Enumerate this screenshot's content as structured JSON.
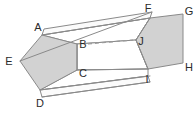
{
  "figure": {
    "shape_type": "pentagonal-prism",
    "style": {
      "stroke_color": "#8a8a8a",
      "face_fill": "#d2d2d2",
      "body_fill": "#ffffff",
      "dashed_edge_color": "#9a9a9a",
      "label_color": "#2b2b2b",
      "background": "#ffffff",
      "stroke_width": 1,
      "label_font_size": 11
    },
    "vertices": [
      {
        "id": "A",
        "label": "A",
        "x": 42,
        "y": 35,
        "label_x": 38,
        "label_y": 30,
        "face": "near-left",
        "hidden": false
      },
      {
        "id": "B",
        "label": "B",
        "x": 77,
        "y": 44,
        "label_x": 75,
        "label_y": 48,
        "face": "far-left",
        "hidden": true
      },
      {
        "id": "C",
        "label": "C",
        "x": 77,
        "y": 70,
        "label_x": 75,
        "label_y": 77,
        "face": "near-left",
        "hidden": false
      },
      {
        "id": "D",
        "label": "D",
        "x": 40,
        "y": 90,
        "label_x": 36,
        "label_y": 105,
        "face": "near-left",
        "hidden": false
      },
      {
        "id": "E",
        "label": "E",
        "x": 20,
        "y": 61,
        "label_x": 5,
        "label_y": 65,
        "face": "near-left",
        "hidden": false
      },
      {
        "id": "F",
        "label": "F",
        "x": 150,
        "y": 18,
        "label_x": 145,
        "label_y": 12,
        "face": "near-right",
        "hidden": false
      },
      {
        "id": "G",
        "label": "G",
        "x": 183,
        "y": 14,
        "label_x": 186,
        "label_y": 14,
        "face": "near-right",
        "hidden": false
      },
      {
        "id": "H",
        "label": "H",
        "x": 183,
        "y": 63,
        "label_x": 186,
        "label_y": 70,
        "face": "near-right",
        "hidden": false
      },
      {
        "id": "I",
        "label": "I",
        "x": 148,
        "y": 69,
        "label_x": 144,
        "label_y": 82,
        "face": "near-right",
        "hidden": false
      },
      {
        "id": "J",
        "label": "J",
        "x": 136,
        "y": 40,
        "label_x": 138,
        "label_y": 44,
        "face": "near-right",
        "hidden": false
      }
    ],
    "faces": [
      {
        "name": "left-pentagon-face",
        "vertex_ids": [
          "A",
          "B",
          "C",
          "D",
          "E"
        ],
        "shaded": true
      },
      {
        "name": "right-pentagon-face",
        "vertex_ids": [
          "F",
          "G",
          "H",
          "I",
          "J"
        ],
        "shaded": true
      }
    ],
    "edges": [
      {
        "name": "A-B",
        "from": "A",
        "to": "B",
        "dashed": false
      },
      {
        "name": "B-C",
        "from": "B",
        "to": "C",
        "dashed": false
      },
      {
        "name": "C-D",
        "from": "C",
        "to": "D",
        "dashed": false
      },
      {
        "name": "D-E",
        "from": "D",
        "to": "E",
        "dashed": false
      },
      {
        "name": "E-A",
        "from": "E",
        "to": "A",
        "dashed": false
      },
      {
        "name": "F-G",
        "from": "F",
        "to": "G",
        "dashed": false
      },
      {
        "name": "G-H",
        "from": "G",
        "to": "H",
        "dashed": false
      },
      {
        "name": "H-I",
        "from": "H",
        "to": "I",
        "dashed": false
      },
      {
        "name": "I-J",
        "from": "I",
        "to": "J",
        "dashed": false
      },
      {
        "name": "J-F",
        "from": "J",
        "to": "F",
        "dashed": false
      },
      {
        "name": "A-F",
        "from": "A",
        "to": "F",
        "dashed": false
      },
      {
        "name": "C-I",
        "from": "C",
        "to": "I",
        "dashed": false
      },
      {
        "name": "D-I",
        "from": "D",
        "to": "I",
        "dashed": false
      },
      {
        "name": "E-F",
        "from": "E",
        "to": "F",
        "dashed": false
      },
      {
        "name": "B-J",
        "from": "B",
        "to": "J",
        "dashed": true
      }
    ],
    "dashed_edges": [
      {
        "name": "hidden-edge-BJ",
        "from": "B",
        "to": "J"
      }
    ]
  }
}
